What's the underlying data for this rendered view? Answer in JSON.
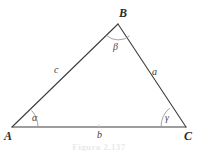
{
  "figure": {
    "background_color": "#ffffff",
    "stroke_color": "#3d3d3d",
    "arc_color": "#8a8a8a",
    "vertices": {
      "a": {
        "label": "A",
        "x": 12,
        "y": 127
      },
      "b": {
        "label": "B",
        "x": 118,
        "y": 24
      },
      "c": {
        "label": "C",
        "x": 186,
        "y": 127
      }
    },
    "sides": [
      {
        "name": "side-c",
        "label": "c",
        "between": "A-B",
        "label_x": 54,
        "label_y": 65
      },
      {
        "name": "side-a",
        "label": "a",
        "between": "B-C",
        "label_x": 152,
        "label_y": 67
      },
      {
        "name": "side-b",
        "label": "b",
        "between": "A-C",
        "label_x": 97,
        "label_y": 130
      }
    ],
    "angles": [
      {
        "name": "angle-alpha",
        "label": "α",
        "at_vertex": "A",
        "label_x": 32,
        "label_y": 113
      },
      {
        "name": "angle-beta",
        "label": "β",
        "at_vertex": "B",
        "label_x": 113,
        "label_y": 42
      },
      {
        "name": "angle-gamma",
        "label": "γ",
        "at_vertex": "C",
        "label_x": 165,
        "label_y": 113
      }
    ],
    "caption": "Figura 2.137"
  }
}
